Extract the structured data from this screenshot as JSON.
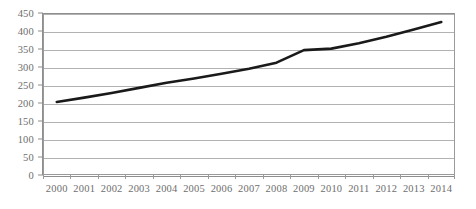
{
  "chart_data": {
    "type": "line",
    "title": "",
    "subtitle": "",
    "xlabel": "",
    "ylabel": "",
    "categories": [
      "2000",
      "2001",
      "2002",
      "2003",
      "2004",
      "2005",
      "2006",
      "2007",
      "2008",
      "2009",
      "2010",
      "2011",
      "2012",
      "2013",
      "2014"
    ],
    "series": [
      {
        "name": "Series 1",
        "color": "#1a1a1a",
        "values": [
          203,
          215,
          228,
          242,
          256,
          268,
          281,
          295,
          312,
          347,
          351,
          366,
          384,
          404,
          425
        ]
      }
    ],
    "ylim": [
      0,
      450
    ],
    "ytick_step": 50,
    "yticks": [
      0,
      50,
      100,
      150,
      200,
      250,
      300,
      350,
      400,
      450
    ],
    "ytick_labels": [
      "0",
      "50",
      "100",
      "150",
      "200",
      "250",
      "300",
      "350",
      "400",
      "450"
    ],
    "xtick_labels": [
      "2000",
      "2001",
      "2002",
      "2003",
      "2004",
      "2005",
      "2006",
      "2007",
      "2008",
      "2009",
      "2010",
      "2011",
      "2012",
      "2013",
      "2014"
    ],
    "grid": {
      "horizontal": true,
      "vertical": false,
      "color": "#b2b2b2"
    },
    "legend": {
      "visible": false,
      "position": "none",
      "entries": []
    },
    "annotations": [],
    "plot_border_color": "#9a9a9a",
    "axis_label_color": "#6e6e6e",
    "background_color": "#ffffff"
  }
}
